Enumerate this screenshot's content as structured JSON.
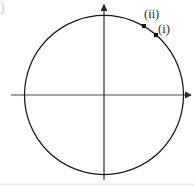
{
  "figure": {
    "corner_mark": ")",
    "background_color": "#ffffff",
    "stroke_color": "#1a1a1a",
    "axis_color": "#4a4a4a",
    "label_color": "#2b2b2b",
    "labels": {
      "point_one": "(i)",
      "point_two": "(ii)"
    }
  },
  "chart_data": {
    "type": "scatter",
    "title": "",
    "subtitle": "",
    "xlabel": "",
    "ylabel": "",
    "xlim": [
      -1.18,
      1.18
    ],
    "ylim": [
      -1.18,
      1.18
    ],
    "grid": false,
    "legend": null,
    "axes": {
      "x_axis": {
        "from_px": 11,
        "to_px": 191,
        "y_px": 95,
        "arrow": "right"
      },
      "y_axis": {
        "from_px": 180,
        "to_px": 5,
        "x_px": 104,
        "arrow": "up"
      }
    },
    "shapes": [
      {
        "kind": "circle",
        "center_px": [
          104,
          95
        ],
        "radius_px": 79.5,
        "center_units": [
          0,
          0
        ],
        "radius_units": 1,
        "filled": false
      }
    ],
    "points": [
      {
        "label": "(i)",
        "x_px": 156,
        "y_px": 35,
        "x": 0.654,
        "y": 0.755,
        "angle_deg": 49,
        "marker": "square"
      },
      {
        "label": "(ii)",
        "x_px": 144,
        "y_px": 26,
        "x": 0.503,
        "y": 0.868,
        "angle_deg": 60,
        "marker": "square"
      },
      {
        "label": "",
        "x_px": 190,
        "y_px": 95,
        "x": 1.08,
        "y": 0,
        "angle_deg": 0,
        "marker": "axis-arrow-dot"
      }
    ],
    "annotations": [
      {
        "text": "(ii)",
        "x_px": 144,
        "y_px": 8,
        "anchor": "left-top"
      },
      {
        "text": "(i)",
        "x_px": 158,
        "y_px": 23,
        "anchor": "left-top"
      }
    ]
  }
}
